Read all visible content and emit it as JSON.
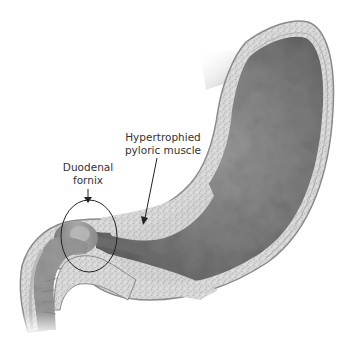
{
  "figure": {
    "labels": {
      "pyloric_muscle": {
        "line1": "Hypertrophied",
        "line2": "pyloric muscle"
      },
      "duodenal_fornix": {
        "line1": "Duodenal",
        "line2": "fornix"
      }
    },
    "colors": {
      "background": "#ffffff",
      "lumen_dark": "#6f6f6f",
      "lumen_mid": "#8c8c8c",
      "muscle_speckle": "#cfcfcf",
      "wall_outline": "#8a8a8a",
      "annotation": "#222222",
      "text": "#333333"
    }
  }
}
